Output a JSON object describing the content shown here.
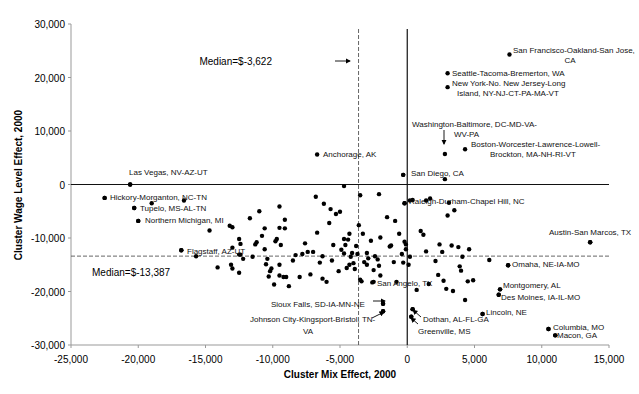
{
  "chart_data": {
    "type": "scatter",
    "title": "",
    "xlabel": "Cluster Mix Effect, 2000",
    "ylabel": "Cluster Wage Level Effect, 2000",
    "xlim": [
      -25000,
      15000
    ],
    "ylim": [
      -30000,
      30000
    ],
    "x_ticks": [
      "-25,000",
      "-20,000",
      "-15,000",
      "-10,000",
      "-5,000",
      "0",
      "5,000",
      "10,000",
      "15,000"
    ],
    "y_ticks": [
      "30,000",
      "20,000",
      "10,000",
      "0",
      "-10,000",
      "-20,000",
      "-30,000"
    ],
    "grid": false,
    "legend": null,
    "reference_lines": [
      {
        "orientation": "vertical",
        "value": -3622,
        "style": "dashed",
        "label": "Median=$-3,622"
      },
      {
        "orientation": "horizontal",
        "value": -13387,
        "style": "dashed",
        "label": "Median=$-13,387"
      },
      {
        "orientation": "vertical",
        "value": 0,
        "style": "solid"
      },
      {
        "orientation": "horizontal",
        "value": 0,
        "style": "solid"
      }
    ],
    "labeled_points": [
      {
        "label": "San Francisco-Oakland-San Jose, CA",
        "x": 7600,
        "y": 24300
      },
      {
        "label": "Seattle-Tacoma-Bremerton, WA",
        "x": 3000,
        "y": 20800
      },
      {
        "label": "New York-No. New Jersey-Long Island, NY-NJ-CT-PA-MA-VT",
        "x": 3000,
        "y": 18200
      },
      {
        "label": "Washington-Baltimore, DC-MD-VA-WV-PA",
        "x": 2800,
        "y": 5700
      },
      {
        "label": "Boston-Worcester-Lawrence-Lowell-Brockton, MA-NH-RI-VT",
        "x": 4300,
        "y": 6600
      },
      {
        "label": "Anchorage, AK",
        "x": -6700,
        "y": 5600
      },
      {
        "label": "San Diego, CA",
        "x": -300,
        "y": 1800
      },
      {
        "label": "Las Vegas, NV-AZ-UT",
        "x": -20600,
        "y": 0
      },
      {
        "label": "Hickory-Morganton, NC-TN",
        "x": -22500,
        "y": -2500
      },
      {
        "label": "Tupelo, MS-AL-TN",
        "x": -20300,
        "y": -4400
      },
      {
        "label": "Northern Michigan, MI",
        "x": -20000,
        "y": -6800
      },
      {
        "label": "Raleigh-Durham-Chapel Hill, NC",
        "x": -200,
        "y": -3500
      },
      {
        "label": "Flagstaff, AZ-UT",
        "x": -16800,
        "y": -12300
      },
      {
        "label": "Austin-San Marcos, TX",
        "x": 13600,
        "y": -10800
      },
      {
        "label": "Omaha, NE-IA-MO",
        "x": 7500,
        "y": -15100
      },
      {
        "label": "Montgomery, AL",
        "x": 6900,
        "y": -19600
      },
      {
        "label": "Des Moines, IA-IL-MO",
        "x": 6800,
        "y": -20600
      },
      {
        "label": "San Angelo, TX",
        "x": -2500,
        "y": -18200
      },
      {
        "label": "Sioux Falls, SD-IA-MN-NE",
        "x": -1800,
        "y": -22300
      },
      {
        "label": "Johnson City-Kingsport-Bristol, TN-VA",
        "x": -1800,
        "y": -23700
      },
      {
        "label": "Lincoln, NE",
        "x": 5600,
        "y": -24200
      },
      {
        "label": "Dothan, AL-FL-GA",
        "x": 400,
        "y": -23300
      },
      {
        "label": "Greenville, MS",
        "x": 300,
        "y": -24700
      },
      {
        "label": "Columbia, MO",
        "x": 10500,
        "y": -27000
      },
      {
        "label": "Macon, GA",
        "x": 11000,
        "y": -28200
      }
    ],
    "points": [
      [
        -22500,
        -2500
      ],
      [
        -20300,
        -4400
      ],
      [
        -20000,
        -6800
      ],
      [
        -20600,
        0
      ],
      [
        -19000,
        -3500
      ],
      [
        -16600,
        -3000
      ],
      [
        -16800,
        -12300
      ],
      [
        -14700,
        -8600
      ],
      [
        -14100,
        -15500
      ],
      [
        -13200,
        -7700
      ],
      [
        -13000,
        -8000
      ],
      [
        -13000,
        -11800
      ],
      [
        -13100,
        -15000
      ],
      [
        -13000,
        -15700
      ],
      [
        -12500,
        -10200
      ],
      [
        -12400,
        -11100
      ],
      [
        -12500,
        -13100
      ],
      [
        -12500,
        -16500
      ],
      [
        -11500,
        -13500
      ],
      [
        -11300,
        -11200
      ],
      [
        -11200,
        -10800
      ],
      [
        -11000,
        -5000
      ],
      [
        -10800,
        -9600
      ],
      [
        -10600,
        -8200
      ],
      [
        -10600,
        -12100
      ],
      [
        -10400,
        -13900
      ],
      [
        -10500,
        -14900
      ],
      [
        -10300,
        -17200
      ],
      [
        -10100,
        -15700
      ],
      [
        -9800,
        -10600
      ],
      [
        -9900,
        -18700
      ],
      [
        -9700,
        -10200
      ],
      [
        -9500,
        -4100
      ],
      [
        -9500,
        -8100
      ],
      [
        -9500,
        -15000
      ],
      [
        -9400,
        -11300
      ],
      [
        -9500,
        -17000
      ],
      [
        -9200,
        -17300
      ],
      [
        -9100,
        -6600
      ],
      [
        -9100,
        -8200
      ],
      [
        -9000,
        -17300
      ],
      [
        -8800,
        -19000
      ],
      [
        -8500,
        -14200
      ],
      [
        -8000,
        -17300
      ],
      [
        -7400,
        -12600
      ],
      [
        -7200,
        -16800
      ],
      [
        -7000,
        -12600
      ],
      [
        -6700,
        -9000
      ],
      [
        -6500,
        -14600
      ],
      [
        -6300,
        -13400
      ],
      [
        -6200,
        -3600
      ],
      [
        -6000,
        -18200
      ],
      [
        -5800,
        -7200
      ],
      [
        -5600,
        -14200
      ],
      [
        -5500,
        -11300
      ],
      [
        -5300,
        -5500
      ],
      [
        -5100,
        -16200
      ],
      [
        -5000,
        -5100
      ],
      [
        -4900,
        -12200
      ],
      [
        -4700,
        -10200
      ],
      [
        -4700,
        -12900
      ],
      [
        -4500,
        -15600
      ],
      [
        -4400,
        -10300
      ],
      [
        -4300,
        -15000
      ],
      [
        -4300,
        -9200
      ],
      [
        -4200,
        -13500
      ],
      [
        -4100,
        -12800
      ],
      [
        -4000,
        -14700
      ],
      [
        -3900,
        -15800
      ],
      [
        -3800,
        -11500
      ],
      [
        -3700,
        -13000
      ],
      [
        -3600,
        -7600
      ],
      [
        -3500,
        -17800
      ],
      [
        -3400,
        -18100
      ],
      [
        -3200,
        -14500
      ],
      [
        -3000,
        -12800
      ],
      [
        -3000,
        -15000
      ],
      [
        -2900,
        -13800
      ],
      [
        -2700,
        -10500
      ],
      [
        -2600,
        -18300
      ],
      [
        -2500,
        -16000
      ],
      [
        -2400,
        -13400
      ],
      [
        -2200,
        -14000
      ],
      [
        -2100,
        -15200
      ],
      [
        -2000,
        -17000
      ],
      [
        -1800,
        -22300
      ],
      [
        -1800,
        -23700
      ],
      [
        -1500,
        -6100
      ],
      [
        -1300,
        -11600
      ],
      [
        -1000,
        -14500
      ],
      [
        -900,
        -6800
      ],
      [
        -800,
        -18200
      ],
      [
        -600,
        -9200
      ],
      [
        -400,
        -13000
      ],
      [
        -300,
        -14600
      ],
      [
        -200,
        -3500
      ],
      [
        -200,
        -10700
      ],
      [
        -100,
        -11200
      ],
      [
        -300,
        1800
      ],
      [
        -100,
        -12100
      ],
      [
        100,
        -15000
      ],
      [
        200,
        -13500
      ],
      [
        200,
        -3000
      ],
      [
        400,
        -2900
      ],
      [
        400,
        -23300
      ],
      [
        300,
        -24700
      ],
      [
        700,
        -19700
      ],
      [
        1000,
        -8700
      ],
      [
        1200,
        -9400
      ],
      [
        1400,
        -12500
      ],
      [
        1600,
        -18600
      ],
      [
        1700,
        -2600
      ],
      [
        2100,
        -14300
      ],
      [
        2300,
        -16900
      ],
      [
        2400,
        -11200
      ],
      [
        2600,
        -12600
      ],
      [
        2700,
        -18000
      ],
      [
        2900,
        -19500
      ],
      [
        3000,
        -5800
      ],
      [
        3100,
        -3400
      ],
      [
        3300,
        -11400
      ],
      [
        3400,
        -19900
      ],
      [
        3500,
        -4800
      ],
      [
        3800,
        -11700
      ],
      [
        3900,
        -15300
      ],
      [
        4000,
        -16100
      ],
      [
        4100,
        -13500
      ],
      [
        4300,
        -21600
      ],
      [
        4500,
        -18100
      ],
      [
        4600,
        -12100
      ],
      [
        4900,
        -17900
      ],
      [
        6100,
        -14100
      ],
      [
        5600,
        -24200
      ],
      [
        7500,
        -15100
      ],
      [
        6900,
        -19600
      ],
      [
        6800,
        -20600
      ],
      [
        13600,
        -10800
      ],
      [
        10500,
        -27000
      ],
      [
        11000,
        -28200
      ],
      [
        -12400,
        -13100
      ],
      [
        -8300,
        -13200
      ],
      [
        -7800,
        -13000
      ],
      [
        -15700,
        -13400
      ],
      [
        -11700,
        -6300
      ],
      [
        -6800,
        -2300
      ],
      [
        -5700,
        -4600
      ],
      [
        -4600,
        -11300
      ],
      [
        -3300,
        -9200
      ],
      [
        -2000,
        -9900
      ],
      [
        -1200,
        -11400
      ],
      [
        2800,
        1000
      ],
      [
        1400,
        -3000
      ],
      [
        -2100,
        -1800
      ],
      [
        -4700,
        -300
      ],
      [
        -3500,
        -2000
      ],
      [
        -6300,
        -17600
      ],
      [
        -7600,
        -11000
      ],
      [
        -12200,
        -13900
      ],
      [
        -10200,
        -16200
      ]
    ]
  },
  "annotations": {
    "median_x": "Median=$-3,622",
    "median_y": "Median=$-13,387"
  }
}
